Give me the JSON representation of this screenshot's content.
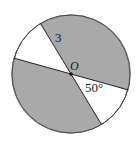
{
  "diagram": {
    "type": "circle-sectors",
    "center_label": "O",
    "radius_label": "3",
    "angle_label": "50°",
    "colors": {
      "shaded": "#a9a9a9",
      "unshaded": "#ffffff",
      "stroke": "#333333"
    }
  }
}
